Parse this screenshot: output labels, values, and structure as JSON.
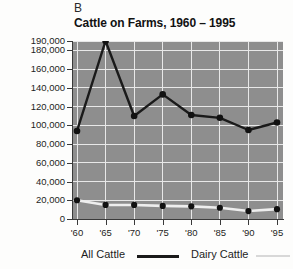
{
  "figure": {
    "panel_letter": "B",
    "title": "Cattle on Farms, 1960 – 1995"
  },
  "colors": {
    "plot_background": "#8e8e8e",
    "gridline": "#e8e8e8",
    "all_cattle_line": "#1a1a1a",
    "dairy_cattle_line": "#eeeeee",
    "marker": "#111111",
    "axis": "#3a3a3a",
    "page_background": "#fdfdfc",
    "text": "#1d1d1d"
  },
  "axes": {
    "y_ticks": [
      "0",
      "20,000",
      "40,000",
      "60,000",
      "80,000",
      "100,000",
      "120,000",
      "140,000",
      "160,000",
      "180,000",
      "190,000"
    ],
    "y_tick_values": [
      0,
      20000,
      40000,
      60000,
      80000,
      100000,
      120000,
      140000,
      160000,
      180000,
      190000
    ],
    "x_ticks": [
      "'60",
      "'65",
      "'70",
      "'75",
      "'80",
      "'85",
      "'90",
      "'95"
    ]
  },
  "legend": {
    "all_cattle_label": "All Cattle",
    "dairy_cattle_label": "Dairy Cattle"
  },
  "chart_data": {
    "type": "line",
    "title": "Cattle on Farms, 1960 – 1995",
    "panel": "B",
    "xlabel": "",
    "ylabel": "",
    "categories": [
      "'60",
      "'65",
      "'70",
      "'75",
      "'80",
      "'85",
      "'90",
      "'95"
    ],
    "x": [
      1960,
      1965,
      1970,
      1975,
      1980,
      1985,
      1990,
      1995
    ],
    "series": [
      {
        "name": "All Cattle",
        "values": [
          94000,
          190000,
          110000,
          133000,
          111000,
          108000,
          95000,
          103000
        ],
        "color": "#1a1a1a",
        "marker": "circle"
      },
      {
        "name": "Dairy Cattle",
        "values": [
          20000,
          15000,
          15000,
          14000,
          13500,
          12000,
          8500,
          10500
        ],
        "color": "#eeeeee",
        "marker": "circle"
      }
    ],
    "ylim": [
      0,
      190000
    ],
    "yticks": [
      0,
      20000,
      40000,
      60000,
      80000,
      100000,
      120000,
      140000,
      160000,
      180000,
      190000
    ],
    "ytick_labels": [
      "0",
      "20,000",
      "40,000",
      "60,000",
      "80,000",
      "100,000",
      "120,000",
      "140,000",
      "160,000",
      "180,000",
      "190,000"
    ],
    "xtick_labels": [
      "'60",
      "'65",
      "'70",
      "'75",
      "'80",
      "'85",
      "'90",
      "'95"
    ],
    "grid": true,
    "grid_axis": "both",
    "legend_position": "below"
  }
}
